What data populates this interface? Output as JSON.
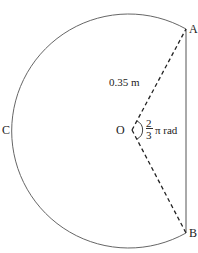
{
  "diagram": {
    "type": "circular sector with chord",
    "labels": {
      "A": "A",
      "B": "B",
      "C": "C",
      "O": "O"
    },
    "radius_label": "0.35 m",
    "angle": {
      "numerator": "2",
      "denominator": "3",
      "suffix": "π rad"
    },
    "colors": {
      "stroke": "#555555",
      "text": "#222222"
    }
  }
}
